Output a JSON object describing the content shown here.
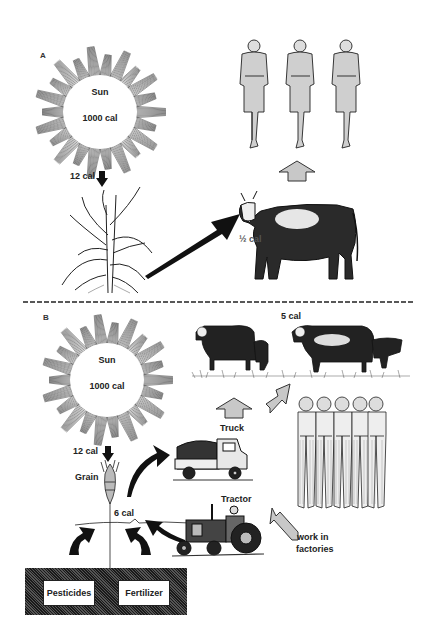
{
  "panel_a": {
    "letter": "A",
    "sun": {
      "title": "Sun",
      "energy": "1000 cal"
    },
    "sun_to_plant": "12 cal",
    "cow_energy": "½ cal"
  },
  "divider": {
    "style": "dashed"
  },
  "panel_b": {
    "letter": "B",
    "sun": {
      "title": "Sun",
      "energy": "1000 cal"
    },
    "sun_to_grain": "12 cal",
    "grain_label": "Grain",
    "grain_energy": "6 cal",
    "cattle_energy": "5 cal",
    "truck_label": "Truck",
    "tractor_label": "Tractor",
    "workers_label_line1": "work in",
    "workers_label_line2": "factories",
    "soil_inputs": [
      "Pesticides",
      "Fertilizer"
    ]
  },
  "colors": {
    "ink": "#1a1a1a",
    "arrow_fill": "#c8c8c8",
    "background": "#ffffff"
  }
}
